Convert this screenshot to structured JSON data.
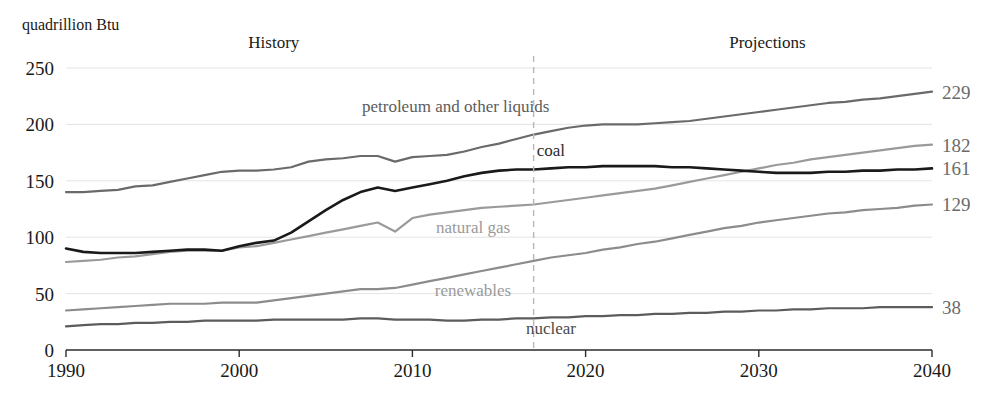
{
  "chart_data": {
    "type": "line",
    "title": "",
    "ylabel": "quadrillion Btu",
    "xlabel": "",
    "xlim": [
      1990,
      2040
    ],
    "ylim": [
      0,
      250
    ],
    "yticks": [
      0,
      50,
      100,
      150,
      200,
      250
    ],
    "ytick_labels": [
      "0",
      "50",
      "100",
      "150",
      "200",
      "250"
    ],
    "xticks": [
      1990,
      2000,
      2010,
      2020,
      2030,
      2040
    ],
    "xtick_labels": [
      "1990",
      "2000",
      "2010",
      "2020",
      "2030",
      "2040"
    ],
    "grid": true,
    "legend_position": "inline",
    "annotations": [
      {
        "name": "history",
        "text": "History",
        "x": 2002
      },
      {
        "name": "projections",
        "text": "Projections",
        "x": 2030.5
      }
    ],
    "divider": {
      "x": 2017,
      "label": "history-projection-divider"
    },
    "series": [
      {
        "name": "petroleum and other liquids",
        "color": "#6a6a6a",
        "width": 2.2,
        "end_value": 229,
        "label_x": 2012.5,
        "label_y": 211,
        "label_color": "#5c5c5c",
        "x": [
          1990,
          1991,
          1992,
          1993,
          1994,
          1995,
          1996,
          1997,
          1998,
          1999,
          2000,
          2001,
          2002,
          2003,
          2004,
          2005,
          2006,
          2007,
          2008,
          2009,
          2010,
          2011,
          2012,
          2013,
          2014,
          2015,
          2016,
          2017,
          2018,
          2019,
          2020,
          2021,
          2022,
          2023,
          2024,
          2025,
          2026,
          2027,
          2028,
          2029,
          2030,
          2031,
          2032,
          2033,
          2034,
          2035,
          2036,
          2037,
          2038,
          2039,
          2040
        ],
        "values": [
          140,
          140,
          141,
          142,
          145,
          146,
          149,
          152,
          155,
          158,
          159,
          159,
          160,
          162,
          167,
          169,
          170,
          172,
          172,
          167,
          171,
          172,
          173,
          176,
          180,
          183,
          187,
          191,
          194,
          197,
          199,
          200,
          200,
          200,
          201,
          202,
          203,
          205,
          207,
          209,
          211,
          213,
          215,
          217,
          219,
          220,
          222,
          223,
          225,
          227,
          229
        ]
      },
      {
        "name": "natural gas",
        "color": "#9a9a9a",
        "width": 2.2,
        "end_value": 182,
        "label_x": 2013.5,
        "label_y": 104,
        "label_color": "#9a9a9a",
        "x": [
          1990,
          1991,
          1992,
          1993,
          1994,
          1995,
          1996,
          1997,
          1998,
          1999,
          2000,
          2001,
          2002,
          2003,
          2004,
          2005,
          2006,
          2007,
          2008,
          2009,
          2010,
          2011,
          2012,
          2013,
          2014,
          2015,
          2016,
          2017,
          2018,
          2019,
          2020,
          2021,
          2022,
          2023,
          2024,
          2025,
          2026,
          2027,
          2028,
          2029,
          2030,
          2031,
          2032,
          2033,
          2034,
          2035,
          2036,
          2037,
          2038,
          2039,
          2040
        ],
        "values": [
          78,
          79,
          80,
          82,
          83,
          85,
          87,
          88,
          88,
          88,
          91,
          92,
          95,
          98,
          101,
          104,
          107,
          110,
          113,
          105,
          117,
          120,
          122,
          124,
          126,
          127,
          128,
          129,
          131,
          133,
          135,
          137,
          139,
          141,
          143,
          146,
          149,
          152,
          155,
          158,
          161,
          164,
          166,
          169,
          171,
          173,
          175,
          177,
          179,
          181,
          182
        ]
      },
      {
        "name": "coal",
        "color": "#1a1a1a",
        "width": 2.6,
        "end_value": 161,
        "label_x": 2018,
        "label_y": 172,
        "label_color": "#2b2b2b",
        "x": [
          1990,
          1991,
          1992,
          1993,
          1994,
          1995,
          1996,
          1997,
          1998,
          1999,
          2000,
          2001,
          2002,
          2003,
          2004,
          2005,
          2006,
          2007,
          2008,
          2009,
          2010,
          2011,
          2012,
          2013,
          2014,
          2015,
          2016,
          2017,
          2018,
          2019,
          2020,
          2021,
          2022,
          2023,
          2024,
          2025,
          2026,
          2027,
          2028,
          2029,
          2030,
          2031,
          2032,
          2033,
          2034,
          2035,
          2036,
          2037,
          2038,
          2039,
          2040
        ],
        "values": [
          90,
          87,
          86,
          86,
          86,
          87,
          88,
          89,
          89,
          88,
          92,
          95,
          97,
          104,
          114,
          124,
          133,
          140,
          144,
          141,
          144,
          147,
          150,
          154,
          157,
          159,
          160,
          160,
          161,
          162,
          162,
          163,
          163,
          163,
          163,
          162,
          162,
          161,
          160,
          159,
          158,
          157,
          157,
          157,
          158,
          158,
          159,
          159,
          160,
          160,
          161
        ]
      },
      {
        "name": "renewables",
        "color": "#8c8c8c",
        "width": 2.2,
        "end_value": 129,
        "label_x": 2013.5,
        "label_y": 48,
        "label_color": "#9a9a9a",
        "x": [
          1990,
          1991,
          1992,
          1993,
          1994,
          1995,
          1996,
          1997,
          1998,
          1999,
          2000,
          2001,
          2002,
          2003,
          2004,
          2005,
          2006,
          2007,
          2008,
          2009,
          2010,
          2011,
          2012,
          2013,
          2014,
          2015,
          2016,
          2017,
          2018,
          2019,
          2020,
          2021,
          2022,
          2023,
          2024,
          2025,
          2026,
          2027,
          2028,
          2029,
          2030,
          2031,
          2032,
          2033,
          2034,
          2035,
          2036,
          2037,
          2038,
          2039,
          2040
        ],
        "values": [
          35,
          36,
          37,
          38,
          39,
          40,
          41,
          41,
          41,
          42,
          42,
          42,
          44,
          46,
          48,
          50,
          52,
          54,
          54,
          55,
          58,
          61,
          64,
          67,
          70,
          73,
          76,
          79,
          82,
          84,
          86,
          89,
          91,
          94,
          96,
          99,
          102,
          105,
          108,
          110,
          113,
          115,
          117,
          119,
          121,
          122,
          124,
          125,
          126,
          128,
          129
        ]
      },
      {
        "name": "nuclear",
        "color": "#5c5c5c",
        "width": 2.2,
        "end_value": 38,
        "label_x": 2018,
        "label_y": 14,
        "label_color": "#4a4a4a",
        "x": [
          1990,
          1991,
          1992,
          1993,
          1994,
          1995,
          1996,
          1997,
          1998,
          1999,
          2000,
          2001,
          2002,
          2003,
          2004,
          2005,
          2006,
          2007,
          2008,
          2009,
          2010,
          2011,
          2012,
          2013,
          2014,
          2015,
          2016,
          2017,
          2018,
          2019,
          2020,
          2021,
          2022,
          2023,
          2024,
          2025,
          2026,
          2027,
          2028,
          2029,
          2030,
          2031,
          2032,
          2033,
          2034,
          2035,
          2036,
          2037,
          2038,
          2039,
          2040
        ],
        "values": [
          21,
          22,
          23,
          23,
          24,
          24,
          25,
          25,
          26,
          26,
          26,
          26,
          27,
          27,
          27,
          27,
          27,
          28,
          28,
          27,
          27,
          27,
          26,
          26,
          27,
          27,
          28,
          28,
          29,
          29,
          30,
          30,
          31,
          31,
          32,
          32,
          33,
          33,
          34,
          34,
          35,
          35,
          36,
          36,
          37,
          37,
          37,
          38,
          38,
          38,
          38
        ]
      }
    ],
    "colors": {
      "gridline": "#e4e4e4",
      "axis": "#2b2b2b",
      "divider": "#b8b8b8",
      "end_value_text": "#6a6a6a",
      "background": "#ffffff"
    }
  }
}
